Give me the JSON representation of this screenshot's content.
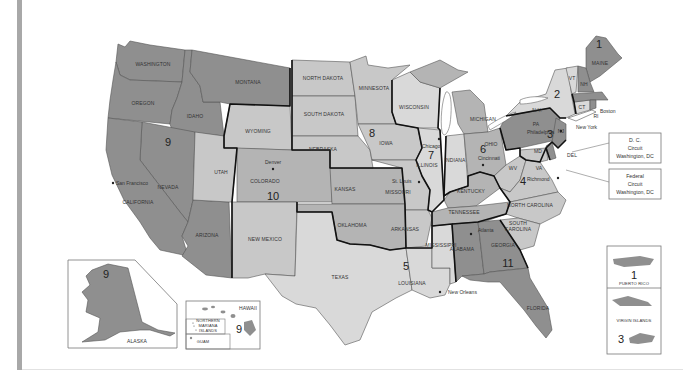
{
  "map": {
    "title": "Federal Judicial Circuits",
    "colors": {
      "dark": "#8f8f8f",
      "mid": "#a9a9a9",
      "light": "#c8c8c8",
      "lighter": "#d9d9d9",
      "water": "#ffffff",
      "circuit_border": "#111111"
    },
    "states": {
      "washington": "WASHINGTON",
      "oregon": "OREGON",
      "california": "CALIFORNIA",
      "nevada": "NEVADA",
      "idaho": "IDAHO",
      "montana": "MONTANA",
      "arizona": "ARIZONA",
      "wyoming": "WYOMING",
      "utah": "UTAH",
      "colorado": "COLORADO",
      "new_mexico": "NEW MEXICO",
      "kansas": "KANSAS",
      "oklahoma": "OKLAHOMA",
      "north_dakota": "NORTH DAKOTA",
      "south_dakota": "SOUTH DAKOTA",
      "nebraska": "NEBRASKA",
      "minnesota": "MINNESOTA",
      "iowa": "IOWA",
      "missouri": "MISSOURI",
      "arkansas": "ARKANSAS",
      "texas": "TEXAS",
      "louisiana": "LOUISIANA",
      "mississippi": "MISSISSIPPI",
      "wisconsin": "WISCONSIN",
      "illinois": "ILLINOIS",
      "indiana": "INDIANA",
      "michigan": "MICHIGAN",
      "ohio": "OHIO",
      "kentucky": "KENTUCKY",
      "tennessee": "TENNESSEE",
      "alabama": "ALABAMA",
      "georgia": "GEORGIA",
      "florida": "FLORIDA",
      "south_carolina": "SOUTH CAROLINA",
      "north_carolina": "NORTH CAROLINA",
      "virginia": "VA",
      "west_virginia": "WV",
      "maryland": "MD",
      "delaware": "DEL",
      "new_jersey": "NJ",
      "pennsylvania": "PA",
      "new_york": "N.Y.",
      "vermont": "VT",
      "new_hampshire": "NH",
      "maine": "MAINE",
      "massachusetts": "MA",
      "connecticut": "CT",
      "rhode_island": "RI",
      "alaska": "ALASKA",
      "hawaii": "HAWAII",
      "northern_mariana": "NORTHERN MARIANA ISLANDS",
      "northern_mariana_lines": [
        "NORTHERN",
        "MARIANA",
        "ISLANDS"
      ],
      "guam": "GUAM",
      "puerto_rico": "PUERTO RICO",
      "virgin_islands": "VIRGIN ISLANDS"
    },
    "cities": {
      "san_francisco": "San Francisco",
      "denver": "Denver",
      "st_louis": "St. Louis",
      "chicago": "Chicago",
      "cincinnati": "Cincinnati",
      "new_orleans": "New Orleans",
      "atlanta": "Atlanta",
      "richmond": "Richmond",
      "philadelphia": "Philadelphia",
      "new_york": "New York",
      "boston": "Boston"
    },
    "circuits": {
      "c1": "1",
      "c2": "2",
      "c3": "3",
      "c4": "4",
      "c5": "5",
      "c6": "6",
      "c7": "7",
      "c8": "8",
      "c9": "9",
      "c10": "10",
      "c11": "11",
      "c9_alaska": "9",
      "c9_hawaii": "9",
      "c1_pr": "1",
      "c3_vi": "3"
    },
    "callouts": {
      "dc": {
        "line1": "D. C.",
        "line2": "Circuit",
        "line3": "Washington, DC"
      },
      "federal": {
        "line1": "Federal",
        "line2": "Circuit",
        "line3": "Washington, DC"
      }
    }
  }
}
